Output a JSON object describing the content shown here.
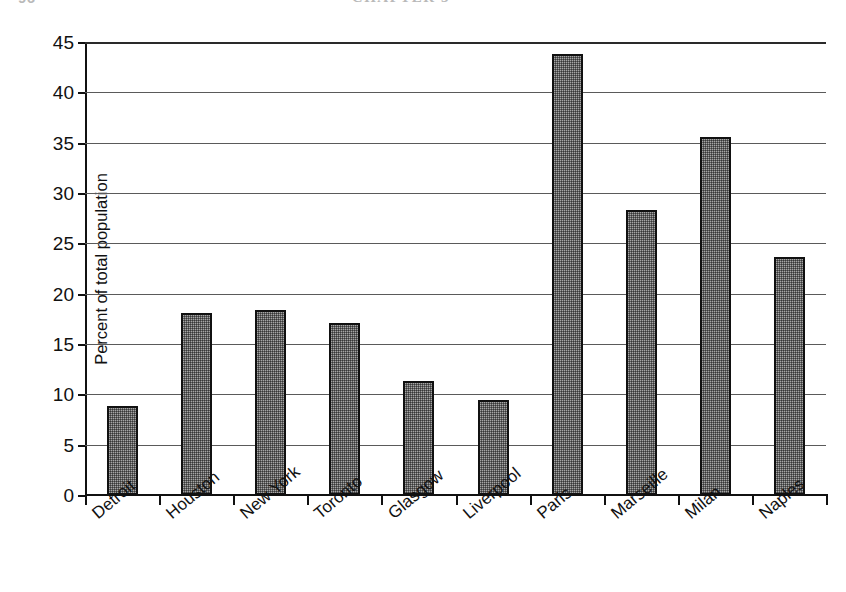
{
  "running_head": {
    "page_number": "96",
    "title": "CHAPTER 5"
  },
  "chart_data": {
    "type": "bar",
    "title": "",
    "subtitle": "",
    "xlabel": "",
    "ylabel": "Percent of total population",
    "ylim": [
      0,
      45
    ],
    "ytick_step": 5,
    "ytick_labels": [
      "0",
      "5",
      "10",
      "15",
      "20",
      "25",
      "30",
      "35",
      "40",
      "45"
    ],
    "ytick_values": [
      0,
      5,
      10,
      15,
      20,
      25,
      30,
      35,
      40,
      45
    ],
    "grid": "horizontal",
    "legend": "none",
    "bar_fill": "#a6a6a6",
    "bar_border": "#111111",
    "categories": [
      "Detroit",
      "Houston",
      "New York",
      "Toronto",
      "Glasgow",
      "Liverpool",
      "Paris",
      "Marseille",
      "Milan",
      "Naples"
    ],
    "values": [
      8.8,
      18.1,
      18.4,
      17.1,
      11.3,
      9.4,
      43.8,
      28.3,
      35.6,
      23.6
    ],
    "annotations": []
  }
}
